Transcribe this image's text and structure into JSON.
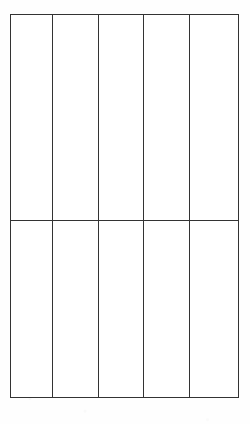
{
  "document": {
    "type": "blank-table-grid",
    "background_color": "#fefefe",
    "line_color": "#333333",
    "cell_fill_color": "#ffffff",
    "line_width_px": 1
  },
  "table": {
    "left_px": 10,
    "top_px": 14,
    "right_px": 238,
    "bottom_px": 397,
    "width_px": 228,
    "height_px": 383,
    "column_count": 5,
    "row_count": 2,
    "column_x_positions": [
      10,
      52,
      98,
      143,
      189,
      238
    ],
    "row_y_positions": [
      14,
      220,
      397
    ],
    "column_widths_px": [
      42,
      46,
      45,
      46,
      49
    ],
    "row_heights_px": [
      206,
      177
    ],
    "columns": [
      {
        "index": 0,
        "header": "",
        "width_px": 42
      },
      {
        "index": 1,
        "header": "",
        "width_px": 46
      },
      {
        "index": 2,
        "header": "",
        "width_px": 45
      },
      {
        "index": 3,
        "header": "",
        "width_px": 46
      },
      {
        "index": 4,
        "header": "",
        "width_px": 49
      }
    ],
    "rows": [
      {
        "index": 0,
        "height_px": 206,
        "cells": [
          "",
          "",
          "",
          "",
          ""
        ]
      },
      {
        "index": 1,
        "height_px": 177,
        "cells": [
          "",
          "",
          "",
          "",
          ""
        ]
      }
    ]
  }
}
